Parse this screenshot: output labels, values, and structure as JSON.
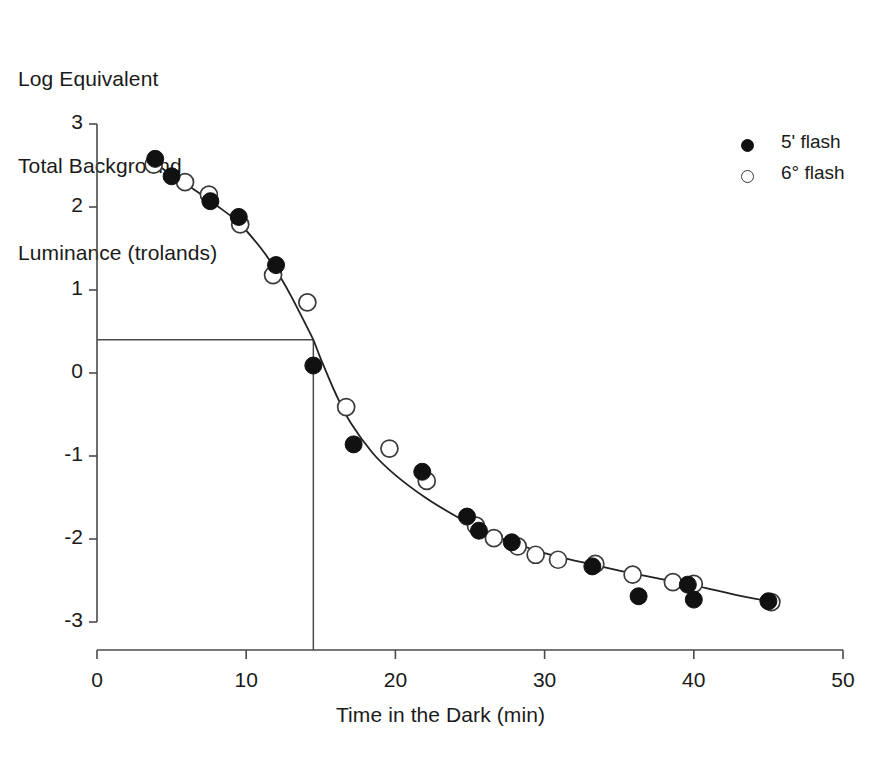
{
  "chart_data": {
    "type": "scatter",
    "title": "",
    "ylabel": "Log Equivalent\nTotal Background\nLuminance (trolands)",
    "xlabel": "Time in the Dark (min)",
    "xlim": [
      0,
      50
    ],
    "ylim": [
      -3,
      3
    ],
    "xticks": [
      0,
      10,
      20,
      30,
      40,
      50
    ],
    "xtick_labels": [
      "0",
      "10",
      "20",
      "30",
      "40",
      "50"
    ],
    "yticks": [
      3,
      2,
      1,
      0,
      -1,
      -2,
      -3
    ],
    "ytick_labels": [
      "3",
      "2",
      "1",
      "0",
      "-1",
      "-2",
      "-3"
    ],
    "grid": false,
    "legend_position": "top-right",
    "series": [
      {
        "name": "5' flash",
        "marker": "filled-circle",
        "color": "#111111",
        "points": [
          {
            "x": 3.9,
            "y": 2.58
          },
          {
            "x": 5.0,
            "y": 2.37
          },
          {
            "x": 7.6,
            "y": 2.07
          },
          {
            "x": 9.5,
            "y": 1.88
          },
          {
            "x": 12.0,
            "y": 1.3
          },
          {
            "x": 14.5,
            "y": 0.09
          },
          {
            "x": 17.2,
            "y": -0.86
          },
          {
            "x": 21.8,
            "y": -1.19
          },
          {
            "x": 24.8,
            "y": -1.73
          },
          {
            "x": 25.6,
            "y": -1.9
          },
          {
            "x": 27.8,
            "y": -2.04
          },
          {
            "x": 33.2,
            "y": -2.33
          },
          {
            "x": 36.3,
            "y": -2.69
          },
          {
            "x": 39.6,
            "y": -2.55
          },
          {
            "x": 40.0,
            "y": -2.73
          },
          {
            "x": 45.0,
            "y": -2.75
          }
        ]
      },
      {
        "name": "6° flash",
        "marker": "open-circle",
        "color": "#ffffff",
        "points": [
          {
            "x": 3.8,
            "y": 2.51
          },
          {
            "x": 5.9,
            "y": 2.3
          },
          {
            "x": 7.5,
            "y": 2.15
          },
          {
            "x": 9.6,
            "y": 1.79
          },
          {
            "x": 11.8,
            "y": 1.18
          },
          {
            "x": 14.1,
            "y": 0.85
          },
          {
            "x": 16.7,
            "y": -0.41
          },
          {
            "x": 19.6,
            "y": -0.91
          },
          {
            "x": 22.1,
            "y": -1.3
          },
          {
            "x": 25.4,
            "y": -1.84
          },
          {
            "x": 26.6,
            "y": -1.99
          },
          {
            "x": 28.2,
            "y": -2.09
          },
          {
            "x": 29.4,
            "y": -2.19
          },
          {
            "x": 30.9,
            "y": -2.25
          },
          {
            "x": 33.4,
            "y": -2.3
          },
          {
            "x": 35.9,
            "y": -2.43
          },
          {
            "x": 38.6,
            "y": -2.52
          },
          {
            "x": 40.0,
            "y": -2.54
          },
          {
            "x": 45.2,
            "y": -2.76
          }
        ]
      }
    ],
    "fit_curve": {
      "name": "dark adaptation fit",
      "points": [
        {
          "x": 3.6,
          "y": 2.58
        },
        {
          "x": 5.0,
          "y": 2.38
        },
        {
          "x": 6.5,
          "y": 2.21
        },
        {
          "x": 8.0,
          "y": 2.02
        },
        {
          "x": 9.5,
          "y": 1.81
        },
        {
          "x": 11.0,
          "y": 1.5
        },
        {
          "x": 12.0,
          "y": 1.24
        },
        {
          "x": 13.0,
          "y": 0.93
        },
        {
          "x": 14.0,
          "y": 0.58
        },
        {
          "x": 14.5,
          "y": 0.4
        },
        {
          "x": 15.0,
          "y": 0.17
        },
        {
          "x": 16.0,
          "y": -0.25
        },
        {
          "x": 17.0,
          "y": -0.6
        },
        {
          "x": 18.5,
          "y": -0.97
        },
        {
          "x": 20.0,
          "y": -1.23
        },
        {
          "x": 22.0,
          "y": -1.5
        },
        {
          "x": 24.0,
          "y": -1.72
        },
        {
          "x": 26.0,
          "y": -1.91
        },
        {
          "x": 28.0,
          "y": -2.05
        },
        {
          "x": 30.0,
          "y": -2.17
        },
        {
          "x": 32.5,
          "y": -2.28
        },
        {
          "x": 35.0,
          "y": -2.38
        },
        {
          "x": 37.5,
          "y": -2.47
        },
        {
          "x": 40.0,
          "y": -2.56
        },
        {
          "x": 42.5,
          "y": -2.66
        },
        {
          "x": 45.3,
          "y": -2.76
        }
      ]
    },
    "reference_lines": {
      "horizontal_y": 0.4,
      "vertical_x": 14.5,
      "description": "rod-cone break reference lines"
    }
  },
  "legend": {
    "entries": [
      {
        "label": "5' flash",
        "marker": "filled-circle"
      },
      {
        "label": "6° flash",
        "marker": "open-circle"
      }
    ]
  },
  "axis_titles": {
    "y_line1": "Log Equivalent",
    "y_line2": "Total Background",
    "y_line3": "Luminance (trolands)",
    "x": "Time in the Dark (min)"
  },
  "colors": {
    "axis": "#4a4a4a",
    "curve": "#222222",
    "filled_marker": "#111111",
    "open_marker_stroke": "#3a3a3a",
    "text": "#1a1a1a",
    "background": "#ffffff"
  }
}
